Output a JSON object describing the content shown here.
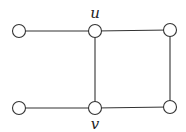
{
  "diagram": {
    "type": "graph",
    "nodes": [
      {
        "id": "a",
        "x": 19,
        "y": 31,
        "label": ""
      },
      {
        "id": "u",
        "x": 95,
        "y": 31,
        "label": "u"
      },
      {
        "id": "b",
        "x": 170,
        "y": 30,
        "label": ""
      },
      {
        "id": "c",
        "x": 19,
        "y": 108,
        "label": ""
      },
      {
        "id": "v",
        "x": 95,
        "y": 108,
        "label": "v"
      },
      {
        "id": "d",
        "x": 170,
        "y": 107,
        "label": ""
      }
    ],
    "edges": [
      [
        "a",
        "u"
      ],
      [
        "u",
        "b"
      ],
      [
        "u",
        "v"
      ],
      [
        "b",
        "d"
      ],
      [
        "c",
        "v"
      ],
      [
        "v",
        "d"
      ]
    ],
    "labels": {
      "u": "u",
      "v": "v"
    }
  }
}
